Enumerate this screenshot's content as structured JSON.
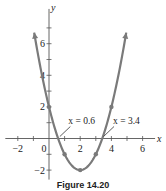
{
  "chart_data": {
    "type": "line",
    "title": "",
    "function": "y = x^2 - 4x + 2",
    "xlabel": "x",
    "ylabel": "y",
    "xlim": [
      -2.8,
      6.8
    ],
    "ylim": [
      -2.6,
      8.2
    ],
    "x_ticks": [
      -2,
      0,
      2,
      4,
      6
    ],
    "y_ticks": [
      -2,
      2,
      4,
      6
    ],
    "x_tick_labels": [
      "−2",
      "0",
      "2",
      "4",
      "6"
    ],
    "y_tick_labels": [
      "−2",
      "2",
      "4",
      "6"
    ],
    "points": [
      {
        "x": 0,
        "y": 2
      },
      {
        "x": 1,
        "y": -1
      },
      {
        "x": 2,
        "y": -2
      },
      {
        "x": 3,
        "y": -1
      },
      {
        "x": 4,
        "y": 2
      }
    ],
    "annotations": [
      {
        "text": "x = 0.6",
        "x": 0.6,
        "y": 0
      },
      {
        "text": "x = 3.4",
        "x": 3.4,
        "y": 0
      }
    ],
    "curve_color": "#7a7a7a",
    "grid": false
  },
  "caption": "Figure 14.20"
}
